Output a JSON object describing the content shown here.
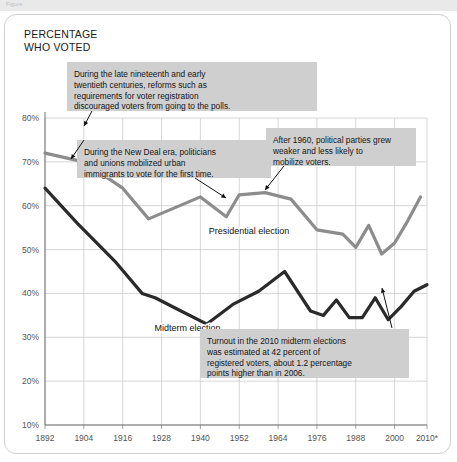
{
  "topbar": {
    "text": "Figure"
  },
  "axis_title": "PERCENTAGE\nWHO VOTED",
  "chart_data": {
    "type": "line",
    "xlabel": "",
    "ylabel": "PERCENTAGE WHO VOTED",
    "xlim": [
      1892,
      2010
    ],
    "ylim": [
      10,
      80
    ],
    "grid": true,
    "legend": "inline-labels",
    "ytick_labels": [
      "10%",
      "20%",
      "30%",
      "40%",
      "50%",
      "60%",
      "70%",
      "80%"
    ],
    "ytick_values": [
      10,
      20,
      30,
      40,
      50,
      60,
      70,
      80
    ],
    "xtick_labels": [
      "1892",
      "1904",
      "1916",
      "1928",
      "1940",
      "1952",
      "1964",
      "1976",
      "1988",
      "2000",
      "2010*"
    ],
    "xtick_values": [
      1892,
      1904,
      1916,
      1928,
      1940,
      1952,
      1964,
      1976,
      1988,
      2000,
      2010
    ],
    "series": [
      {
        "name": "Presidential election",
        "color": "#8c8c8c",
        "label_x": 1955,
        "label_y": 53.5,
        "x": [
          1892,
          1904,
          1916,
          1924,
          1932,
          1940,
          1948,
          1952,
          1960,
          1968,
          1976,
          1984,
          1988,
          1992,
          1996,
          2000,
          2004,
          2008
        ],
        "values": [
          72.0,
          70.0,
          64.0,
          57.0,
          59.5,
          62.0,
          57.5,
          62.5,
          63.0,
          61.5,
          54.5,
          53.5,
          50.5,
          55.5,
          49.0,
          51.5,
          56.5,
          62.0
        ]
      },
      {
        "name": "Midterm election",
        "color": "#2a2a2a",
        "label_x": 1936,
        "label_y": 31.5,
        "x": [
          1892,
          1902,
          1914,
          1922,
          1926,
          1934,
          1942,
          1950,
          1958,
          1966,
          1974,
          1978,
          1982,
          1986,
          1990,
          1994,
          1998,
          2002,
          2006,
          2010
        ],
        "values": [
          64.0,
          56.0,
          47.0,
          40.0,
          39.0,
          36.0,
          33.0,
          37.5,
          40.5,
          45.0,
          36.0,
          35.0,
          38.5,
          34.5,
          34.5,
          39.0,
          34.0,
          37.0,
          40.5,
          42.0
        ]
      }
    ],
    "annotations": [
      {
        "id": "annotation-reforms",
        "lines": [
          "During the late nineteenth and early",
          "twentieth centuries, reforms such as",
          "requirements for voter registration",
          "discouraged voters from going to the polls."
        ]
      },
      {
        "id": "annotation-new-deal",
        "lines": [
          "During the New Deal era, politicians",
          "and unions mobilized urban",
          "immigrants to vote for the first time."
        ]
      },
      {
        "id": "annotation-after-1960",
        "lines": [
          "After 1960, political parties grew",
          "weaker and less likely to",
          "mobilize voters."
        ]
      },
      {
        "id": "annotation-2010-turnout",
        "lines": [
          "Turnout in the 2010 midterm elections",
          "was estimated at 42 percent of",
          "registered voters, about 1.2 percentage",
          "points higher than in 2006."
        ]
      }
    ]
  }
}
